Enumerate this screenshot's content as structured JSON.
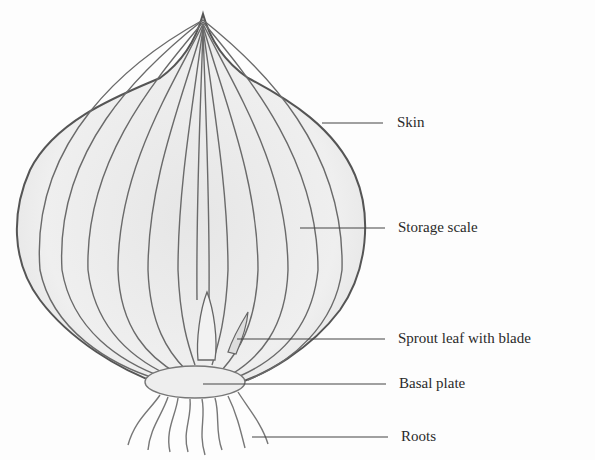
{
  "diagram": {
    "labels": [
      {
        "id": "skin",
        "text": "Skin",
        "y": 123
      },
      {
        "id": "storage-scale",
        "text": "Storage scale",
        "y": 228
      },
      {
        "id": "sprout-leaf",
        "text": "Sprout leaf with blade",
        "y": 339
      },
      {
        "id": "basal-plate",
        "text": "Basal plate",
        "y": 384
      },
      {
        "id": "roots",
        "text": "Roots",
        "y": 437
      }
    ]
  }
}
